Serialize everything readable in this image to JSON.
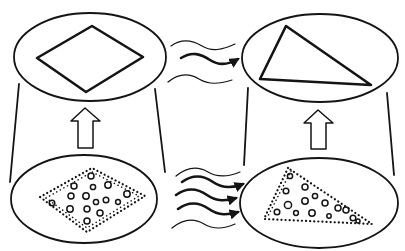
{
  "diagram": {
    "title": "",
    "colors": {
      "stroke": "#141414",
      "background": "#ffffff"
    },
    "panels": [
      {
        "id": "top-left",
        "shape": "diamond",
        "style": "solid outline",
        "ellipse": {
          "cx": 90,
          "cy": 57,
          "rx": 76,
          "ry": 44
        }
      },
      {
        "id": "top-right",
        "shape": "triangle",
        "style": "solid outline",
        "ellipse": {
          "cx": 320,
          "cy": 58,
          "rx": 78,
          "ry": 44
        }
      },
      {
        "id": "bottom-left",
        "shape": "diamond",
        "style": "dotted outline with circles",
        "ellipse": {
          "cx": 84,
          "cy": 199,
          "rx": 73,
          "ry": 44
        }
      },
      {
        "id": "bottom-right",
        "shape": "triangle",
        "style": "dotted outline with circles",
        "ellipse": {
          "cx": 319,
          "cy": 203,
          "rx": 79,
          "ry": 45
        }
      }
    ],
    "arrows": [
      {
        "id": "up-left",
        "type": "hollow block arrow",
        "from": "bottom-left",
        "to": "top-left"
      },
      {
        "id": "up-right",
        "type": "hollow block arrow",
        "from": "bottom-right",
        "to": "top-right"
      },
      {
        "id": "wavy-top",
        "type": "wavy arrow",
        "count_bold": 1,
        "count_thin": 2,
        "from": "top-left",
        "to": "top-right"
      },
      {
        "id": "wavy-bottom",
        "type": "wavy arrow",
        "count_bold": 3,
        "count_thin": 2,
        "from": "bottom-left",
        "to": "bottom-right"
      }
    ],
    "labels": []
  }
}
